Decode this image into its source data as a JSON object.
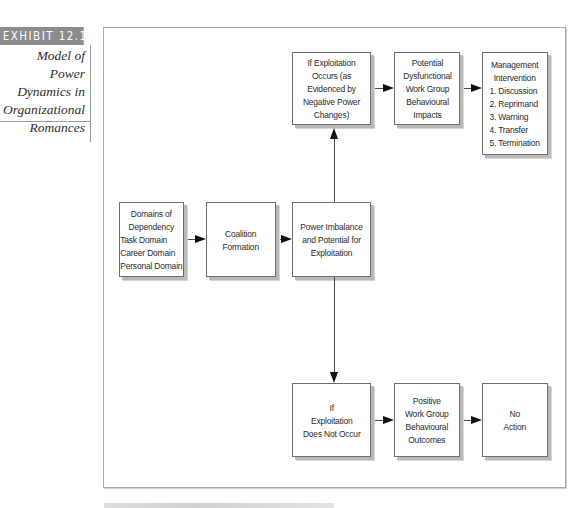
{
  "exhibit": {
    "label": "EXHIBIT 12.1",
    "title_lines": [
      "Model of Power",
      "Dynamics in",
      "Organizational",
      "Romances"
    ]
  },
  "diagram": {
    "boxes": {
      "domains": {
        "lines": [
          "Domains of",
          "Dependency",
          "Task Domain",
          "Career Domain",
          "Personal Domain"
        ]
      },
      "coalition": {
        "lines": [
          "Coalition",
          "Formation"
        ]
      },
      "power": {
        "lines": [
          "Power Imbalance",
          "and Potential for",
          "Exploitation"
        ]
      },
      "exploitation_occurs": {
        "lines": [
          "If Exploitation",
          "Occurs (as",
          "Evidenced by",
          "Negative Power",
          "Changes)"
        ]
      },
      "dysfunctional": {
        "lines": [
          "Potential",
          "Dysfunctional",
          "Work Group",
          "Behavioural",
          "Impacts"
        ]
      },
      "management": {
        "lines": [
          "Management",
          "Intervention",
          "1. Discussion",
          "2. Reprimand",
          "3. Warning",
          "4. Transfer",
          "5. Termination"
        ]
      },
      "no_exploitation": {
        "lines": [
          "If",
          "Exploitation",
          "Does Not Occur"
        ]
      },
      "positive": {
        "lines": [
          "Positive",
          "Work Group",
          "Behavioural",
          "Outcomes"
        ]
      },
      "no_action": {
        "lines": [
          "No",
          "Action"
        ]
      }
    },
    "edges": [
      {
        "from": "domains",
        "to": "coalition"
      },
      {
        "from": "coalition",
        "to": "power"
      },
      {
        "from": "power",
        "to": "exploitation_occurs"
      },
      {
        "from": "power",
        "to": "no_exploitation"
      },
      {
        "from": "exploitation_occurs",
        "to": "dysfunctional"
      },
      {
        "from": "dysfunctional",
        "to": "management"
      },
      {
        "from": "no_exploitation",
        "to": "positive"
      },
      {
        "from": "positive",
        "to": "no_action"
      }
    ],
    "colors": {
      "exhibit_band": "#8c8c8c",
      "box_border": "#6f6f6f",
      "box_shadow": "#b9b9b9",
      "arrow": "#111111",
      "frame": "#a8a8a8"
    }
  }
}
